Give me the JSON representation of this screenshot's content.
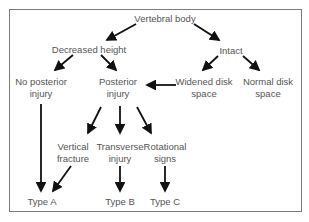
{
  "diagram": {
    "nodes": {
      "root": {
        "line1": "Vertebral body",
        "line2": ""
      },
      "decreased": {
        "line1": "Decreased height",
        "line2": ""
      },
      "intact": {
        "line1": "Intact",
        "line2": ""
      },
      "no_posterior": {
        "line1": "No posterior",
        "line2": "injury"
      },
      "posterior": {
        "line1": "Posterior",
        "line2": "injury"
      },
      "widened": {
        "line1": "Widened disk",
        "line2": "space"
      },
      "normal": {
        "line1": "Normal disk",
        "line2": "space"
      },
      "vertical": {
        "line1": "Vertical",
        "line2": "fracture"
      },
      "transverse": {
        "line1": "Transverse",
        "line2": "injury"
      },
      "rotational": {
        "line1": "Rotational",
        "line2": "signs"
      },
      "type_a": {
        "line1": "Type A",
        "line2": ""
      },
      "type_b": {
        "line1": "Type B",
        "line2": ""
      },
      "type_c": {
        "line1": "Type C",
        "line2": ""
      }
    },
    "edges": [
      [
        "root",
        "decreased"
      ],
      [
        "root",
        "intact"
      ],
      [
        "decreased",
        "no_posterior"
      ],
      [
        "decreased",
        "posterior"
      ],
      [
        "intact",
        "widened"
      ],
      [
        "intact",
        "normal"
      ],
      [
        "widened",
        "posterior"
      ],
      [
        "posterior",
        "vertical"
      ],
      [
        "posterior",
        "transverse"
      ],
      [
        "posterior",
        "rotational"
      ],
      [
        "no_posterior",
        "type_a"
      ],
      [
        "vertical",
        "type_a"
      ],
      [
        "transverse",
        "type_b"
      ],
      [
        "rotational",
        "type_c"
      ]
    ],
    "colors": {
      "text": "#555555",
      "arrow": "#111111",
      "border": "#7a7a7a"
    }
  }
}
